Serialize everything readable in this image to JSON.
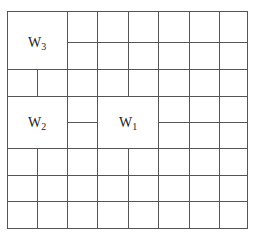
{
  "diagram": {
    "type": "grid-window-partition",
    "grid": {
      "columns": 8,
      "rows": 8
    },
    "colors": {
      "line": "#555555",
      "text": "#222222",
      "background": "#ffffff"
    },
    "blocks": [
      {
        "id": "W3",
        "letter": "W",
        "subscript": "3",
        "cols": [
          0,
          2
        ],
        "rows": [
          0,
          2
        ]
      },
      {
        "id": "W2",
        "letter": "W",
        "subscript": "2",
        "cols": [
          0,
          2
        ],
        "rows": [
          3,
          5
        ]
      },
      {
        "id": "W1",
        "letter": "W",
        "subscript": "1",
        "cols": [
          3,
          5
        ],
        "rows": [
          3,
          5
        ]
      }
    ]
  }
}
